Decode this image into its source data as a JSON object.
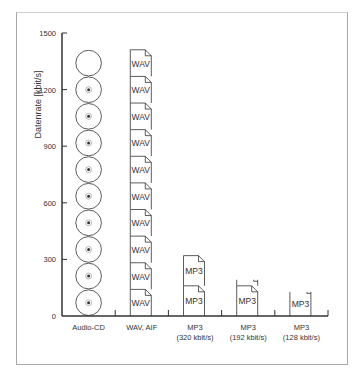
{
  "chart_data": {
    "type": "bar",
    "title": "",
    "xlabel": "",
    "ylabel": "Datenrate [kbit/s]",
    "ylim": [
      0,
      1500
    ],
    "yticks": [
      0,
      300,
      600,
      900,
      1200,
      1500
    ],
    "grid": false,
    "categories": [
      {
        "line1": "Audio-CD",
        "line2": ""
      },
      {
        "line1": "WAV, AIF",
        "line2": ""
      },
      {
        "line1": "MP3",
        "line2": "(320 kbit/s)"
      },
      {
        "line1": "MP3",
        "line2": "(192 kbit/s)"
      },
      {
        "line1": "MP3",
        "line2": "(128 kbit/s)"
      }
    ],
    "values": [
      1411,
      1411,
      320,
      192,
      128
    ],
    "unit_values": [
      141.1,
      141.1,
      160,
      160,
      160
    ],
    "icons": [
      "cd",
      "document",
      "document",
      "document",
      "document"
    ],
    "icon_labels": [
      "",
      "WAV",
      "MP3",
      "MP3",
      "MP3"
    ]
  },
  "colors": {
    "stroke": "#333333",
    "frame": "#a8a8a8"
  }
}
